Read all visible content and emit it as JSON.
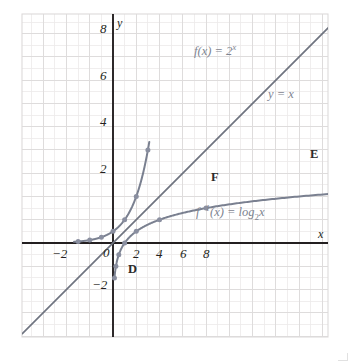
{
  "figure": {
    "kind": "cartesian-graph",
    "background": "#ffffff",
    "plot_box": {
      "x": 22,
      "y": 14,
      "width": 306,
      "height": 323
    },
    "origin_px": {
      "x": 113,
      "y": 243
    },
    "unit_px": 11.63,
    "colors": {
      "curve": "#7a8090",
      "line_yx": "#6f7480",
      "axis": "#231f20",
      "grid_minor": "#eceaea",
      "grid_major": "#dddbdb",
      "plot_border": "#dcdada",
      "point": "#8a8fa0",
      "text": "#231f20",
      "label_text": "#7e8490"
    }
  },
  "chart_data": {
    "type": "line",
    "title": "",
    "xlabel": "x",
    "ylabel": "y",
    "xlim": [
      -7.8,
      18.5
    ],
    "ylim": [
      -19.7,
      8.0
    ],
    "grid": true,
    "grid_step": 1,
    "grid_major_step": 2,
    "legend": "inline-annotations",
    "xticks": [
      -2,
      2,
      4,
      6,
      8
    ],
    "xtick_labels": [
      "−2",
      "2",
      "4",
      "6",
      "8"
    ],
    "yticks": [
      -2,
      2,
      4,
      6,
      8
    ],
    "ytick_labels": [
      "−2",
      "2",
      "4",
      "6",
      "8"
    ],
    "origin_label": "0",
    "series": [
      {
        "name": "f(x) = 2^x",
        "kind": "exponential",
        "base": 2,
        "color": "#7a8090",
        "x_range": [
          -3.35,
          3.12
        ],
        "markers": [
          {
            "x": -3,
            "y": 0.125
          },
          {
            "x": -2,
            "y": 0.25
          },
          {
            "x": -1,
            "y": 0.5
          },
          {
            "x": 0,
            "y": 1
          },
          {
            "x": 1,
            "y": 2
          },
          {
            "x": 2,
            "y": 4
          },
          {
            "x": 3,
            "y": 8
          }
        ]
      },
      {
        "name": "y = x",
        "kind": "linear",
        "slope": 1,
        "intercept": 0,
        "color": "#6f7480",
        "x_range": [
          -7.8,
          18.5
        ],
        "markers": []
      },
      {
        "name": "f^-1(x) = log_2 x",
        "kind": "logarithmic",
        "base": 2,
        "color": "#7a8090",
        "x_range": [
          0.118,
          18.5
        ],
        "markers": [
          {
            "x": 0.125,
            "y": -3
          },
          {
            "x": 0.25,
            "y": -2
          },
          {
            "x": 0.5,
            "y": -1
          },
          {
            "x": 1,
            "y": 0
          },
          {
            "x": 2,
            "y": 1
          },
          {
            "x": 4,
            "y": 2
          },
          {
            "x": 8,
            "y": 3
          }
        ]
      }
    ],
    "point_labels": [
      {
        "text": "D",
        "x": 0.5,
        "y": -1
      },
      {
        "text": "F",
        "x": 4,
        "y": 2
      },
      {
        "text": "E",
        "x": 8,
        "y": 3
      }
    ],
    "annotations": [
      {
        "id": "exp",
        "text": "f(x) = 2^x",
        "x": 3.5,
        "y": 6.9
      },
      {
        "id": "identity",
        "text": "y = x",
        "x": 11.0,
        "y": 5.4
      },
      {
        "id": "log",
        "text": "f^-1(x) = log_2 x",
        "x": 5.0,
        "y": 1.35
      }
    ]
  },
  "labels": {
    "x_axis": "x",
    "y_axis": "y",
    "origin": "0",
    "xticks": [
      "−2",
      "2",
      "4",
      "6",
      "8"
    ],
    "yticks": [
      "8",
      "6",
      "4",
      "2",
      "−2"
    ],
    "point_d": "D",
    "point_e": "E",
    "point_f": "F",
    "exp_fn": "f(x) = 2",
    "exp_exp": "x",
    "identity_fn": "y = x",
    "log_prefix": "f",
    "log_sup": "−1",
    "log_mid": "(x) = log",
    "log_sub": "2",
    "log_suffix": "x"
  }
}
